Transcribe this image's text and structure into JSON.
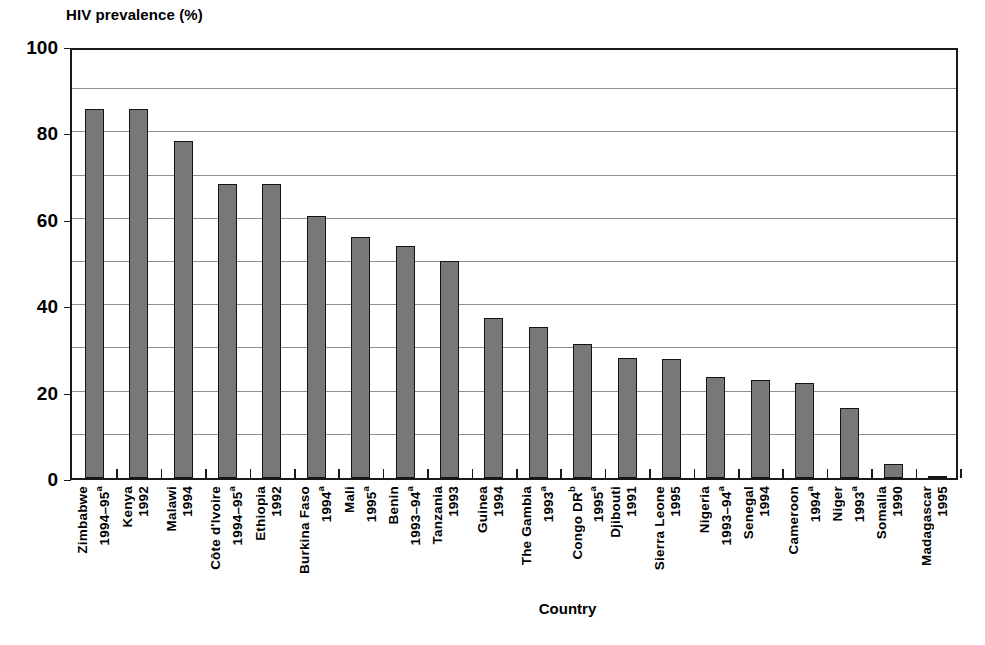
{
  "chart_data": {
    "type": "bar",
    "title": "",
    "ylabel": "HIV prevalence (%)",
    "xlabel": "Country",
    "ylim": [
      0,
      100
    ],
    "yticks": [
      0,
      20,
      40,
      60,
      80,
      100
    ],
    "gridlines": [
      10,
      20,
      30,
      40,
      50,
      60,
      70,
      80,
      90
    ],
    "grid": true,
    "legend": "none",
    "bar_color": "#787878",
    "bar_border_color": "#141414",
    "categories": [
      "Zimbabwe 1994–95a",
      "Kenya 1992",
      "Malawi 1994",
      "Côte d'Ivoire 1994–95a",
      "Ethiopia 1992",
      "Burkina Faso 1994a",
      "Mali 1995a",
      "Benin 1993–94a",
      "Tanzania 1993",
      "Guinea 1994",
      "The Gambia 1993a",
      "Congo DRb 1995a",
      "Djibouti 1991",
      "Sierra Leone 1995",
      "Nigeria 1993–94a",
      "Senegal 1994",
      "Cameroon 1994a",
      "Niger 1993a",
      "Somalia 1990",
      "Madagascar 1995"
    ],
    "values": [
      85.5,
      85.5,
      78.0,
      68.0,
      68.0,
      60.7,
      55.8,
      53.8,
      50.2,
      37.0,
      35.0,
      31.0,
      27.7,
      27.5,
      23.3,
      22.8,
      22.0,
      16.2,
      3.3,
      0.5
    ],
    "bars": [
      {
        "country": "Zimbabwe",
        "country_sup": "",
        "year": "1994–95",
        "year_sup": "a",
        "value": 85.5
      },
      {
        "country": "Kenya",
        "country_sup": "",
        "year": "1992",
        "year_sup": "",
        "value": 85.5
      },
      {
        "country": "Malawi",
        "country_sup": "",
        "year": "1994",
        "year_sup": "",
        "value": 78.0
      },
      {
        "country": "Côte d'Ivoire",
        "country_sup": "",
        "year": "1994–95",
        "year_sup": "a",
        "value": 68.0
      },
      {
        "country": "Ethiopia",
        "country_sup": "",
        "year": "1992",
        "year_sup": "",
        "value": 68.0
      },
      {
        "country": "Burkina Faso",
        "country_sup": "",
        "year": "1994",
        "year_sup": "a",
        "value": 60.7
      },
      {
        "country": "Mali",
        "country_sup": "",
        "year": "1995",
        "year_sup": "a",
        "value": 55.8
      },
      {
        "country": "Benin",
        "country_sup": "",
        "year": "1993–94",
        "year_sup": "a",
        "value": 53.8
      },
      {
        "country": "Tanzania",
        "country_sup": "",
        "year": "1993",
        "year_sup": "",
        "value": 50.2
      },
      {
        "country": "Guinea",
        "country_sup": "",
        "year": "1994",
        "year_sup": "",
        "value": 37.0
      },
      {
        "country": "The Gambia",
        "country_sup": "",
        "year": "1993",
        "year_sup": "a",
        "value": 35.0
      },
      {
        "country": "Congo DR",
        "country_sup": "b",
        "year": "1995",
        "year_sup": "a",
        "value": 31.0
      },
      {
        "country": "Djibouti",
        "country_sup": "",
        "year": "1991",
        "year_sup": "",
        "value": 27.7
      },
      {
        "country": "Sierra Leone",
        "country_sup": "",
        "year": "1995",
        "year_sup": "",
        "value": 27.5
      },
      {
        "country": "Nigeria",
        "country_sup": "",
        "year": "1993–94",
        "year_sup": "a",
        "value": 23.3
      },
      {
        "country": "Senegal",
        "country_sup": "",
        "year": "1994",
        "year_sup": "",
        "value": 22.8
      },
      {
        "country": "Cameroon",
        "country_sup": "",
        "year": "1994",
        "year_sup": "a",
        "value": 22.0
      },
      {
        "country": "Niger",
        "country_sup": "",
        "year": "1993",
        "year_sup": "a",
        "value": 16.2
      },
      {
        "country": "Somalia",
        "country_sup": "",
        "year": "1990",
        "year_sup": "",
        "value": 3.3
      },
      {
        "country": "Madagascar",
        "country_sup": "",
        "year": "1995",
        "year_sup": "",
        "value": 0.5
      }
    ]
  },
  "axes": {
    "y_title": "HIV prevalence (%)",
    "x_title": "Country",
    "y_tick_labels": [
      "100",
      "80",
      "60",
      "40",
      "20",
      "0"
    ]
  }
}
